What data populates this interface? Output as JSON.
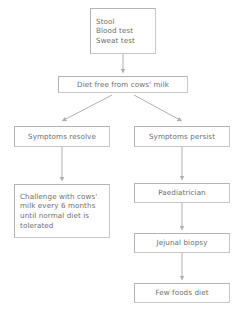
{
  "diagram": {
    "palette": {
      "background": "#ffffff",
      "box_border": "#c8c8c8",
      "box_fill": "#ffffff",
      "text": "#6e6e6e",
      "arrow": "#b0b0b0"
    },
    "nodes": [
      {
        "id": "tests",
        "label": "Stool\nBlood test\nSweat test"
      },
      {
        "id": "diet",
        "label": "Diet free from cows' milk"
      },
      {
        "id": "resolve",
        "label": "Symptoms resolve"
      },
      {
        "id": "persist",
        "label": "Symptoms persist"
      },
      {
        "id": "challenge",
        "label": "Challenge with cows' milk every 6 months until normal diet is tolerated"
      },
      {
        "id": "paediatrician",
        "label": "Paediatrician"
      },
      {
        "id": "biopsy",
        "label": "Jejunal biopsy"
      },
      {
        "id": "fewfoods",
        "label": "Few foods diet"
      }
    ],
    "edges": [
      {
        "from": "tests",
        "to": "diet",
        "style": "vertical-arrow"
      },
      {
        "from": "diet",
        "to": "resolve",
        "style": "diagonal-arrow-left"
      },
      {
        "from": "diet",
        "to": "persist",
        "style": "diagonal-arrow-right"
      },
      {
        "from": "resolve",
        "to": "challenge",
        "style": "vertical-arrow"
      },
      {
        "from": "persist",
        "to": "paediatrician",
        "style": "vertical-arrow"
      },
      {
        "from": "paediatrician",
        "to": "biopsy",
        "style": "vertical-arrow"
      },
      {
        "from": "biopsy",
        "to": "fewfoods",
        "style": "vertical-arrow"
      }
    ]
  }
}
